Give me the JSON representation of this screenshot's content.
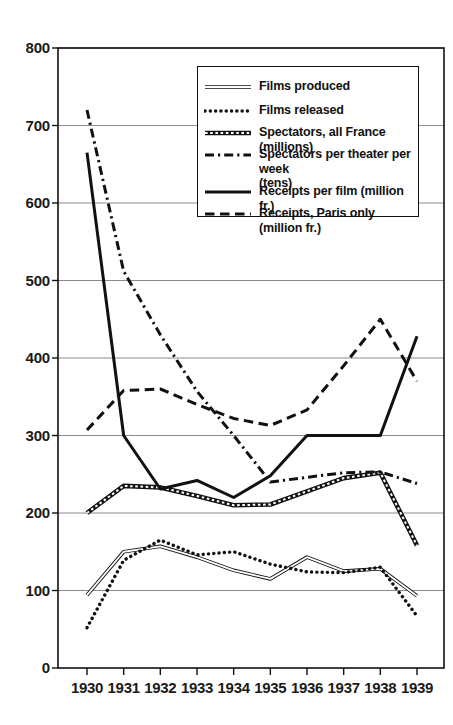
{
  "chart_data": {
    "type": "line",
    "title": "",
    "xlabel": "",
    "ylabel": "",
    "x": [
      1930,
      1931,
      1932,
      1933,
      1934,
      1935,
      1936,
      1937,
      1938,
      1939
    ],
    "xtick_labels": [
      "1930",
      "1931",
      "1932",
      "1933",
      "1934",
      "1935",
      "1936",
      "1937",
      "1938",
      "1939"
    ],
    "ytick_labels": [
      "0",
      "100",
      "200",
      "300",
      "400",
      "500",
      "600",
      "700",
      "800"
    ],
    "ytick_values": [
      0,
      100,
      200,
      300,
      400,
      500,
      600,
      700,
      800
    ],
    "ylim": [
      0,
      800
    ],
    "grid": "horizontal",
    "legend_position": "top-right-inside",
    "series": [
      {
        "name": "Films produced",
        "style": "double-thin-line",
        "values": [
          94,
          150,
          157,
          143,
          126,
          115,
          143,
          125,
          128,
          93
        ]
      },
      {
        "name": "Films released",
        "style": "dotted",
        "values": [
          52,
          139,
          165,
          146,
          150,
          134,
          124,
          123,
          130,
          67
        ]
      },
      {
        "name": "Spectators,  all France (millions)",
        "style": "dotted-thick-outline",
        "values": [
          200,
          235,
          233,
          222,
          210,
          211,
          228,
          245,
          252,
          158
        ]
      },
      {
        "name": "Spectators per theater per week\n(tens)",
        "style": "dash-dot",
        "values": [
          720,
          512,
          430,
          357,
          300,
          240,
          246,
          252,
          253,
          238
        ]
      },
      {
        "name": "Receipts per film (million fr.)",
        "style": "solid-thick",
        "values": [
          665,
          300,
          231,
          242,
          220,
          248,
          300,
          300,
          300,
          428
        ]
      },
      {
        "name": "Receipts, Paris only (million fr.)",
        "style": "dashed-thick",
        "values": [
          307,
          358,
          360,
          340,
          322,
          313,
          333,
          390,
          450,
          370
        ]
      }
    ]
  },
  "axis": {
    "y_label_0": "0",
    "y_label_100": "100",
    "y_label_200": "200",
    "y_label_300": "300",
    "y_label_400": "400",
    "y_label_500": "500",
    "y_label_600": "600",
    "y_label_700": "700",
    "y_label_800": "800"
  },
  "legend": {
    "items": [
      {
        "label": "Films produced"
      },
      {
        "label": "Films released"
      },
      {
        "label": "Spectators,  all France (millions)"
      },
      {
        "label": "Spectators per theater per week\n(tens)"
      },
      {
        "label": "Receipts per film (million fr.)"
      },
      {
        "label": "Receipts, Paris only (million fr.)"
      }
    ]
  },
  "colors": {
    "ink": "#111111",
    "grid": "#8a8a8a",
    "background": "#ffffff"
  }
}
